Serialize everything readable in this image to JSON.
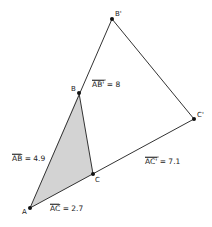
{
  "diagram": {
    "type": "geometry-construction",
    "points": [
      {
        "id": "A",
        "label": "A",
        "x": 30,
        "y": 208,
        "lx": 22,
        "ly": 214
      },
      {
        "id": "B",
        "label": "B",
        "x": 79,
        "y": 93,
        "lx": 71,
        "ly": 91
      },
      {
        "id": "C",
        "label": "C",
        "x": 93,
        "y": 174,
        "lx": 95,
        "ly": 182
      },
      {
        "id": "B'",
        "label": "B'",
        "x": 112,
        "y": 19,
        "lx": 115,
        "ly": 16
      },
      {
        "id": "C'",
        "label": "C'",
        "x": 194,
        "y": 119,
        "lx": 197,
        "ly": 117
      }
    ],
    "shaded_triangle": [
      "A",
      "B",
      "C"
    ],
    "segments": [
      [
        "A",
        "B'"
      ],
      [
        "B'",
        "C'"
      ],
      [
        "A",
        "C'"
      ],
      [
        "B",
        "C"
      ]
    ],
    "measurements": [
      {
        "id": "AB_prime",
        "seg": "AB'",
        "eq": " = 8",
        "x": 92,
        "y": 87
      },
      {
        "id": "AB",
        "seg": "AB",
        "eq": " = 4.9",
        "x": 12,
        "y": 161
      },
      {
        "id": "AC_prime",
        "seg": "AC'",
        "eq": " = 7.1",
        "x": 145,
        "y": 164
      },
      {
        "id": "AC",
        "seg": "AC",
        "eq": " = 2.7",
        "x": 50,
        "y": 211
      }
    ],
    "colors": {
      "fill": "#d3d3d3",
      "stroke": "#333333",
      "point": "#111111",
      "background": "#ffffff"
    }
  }
}
